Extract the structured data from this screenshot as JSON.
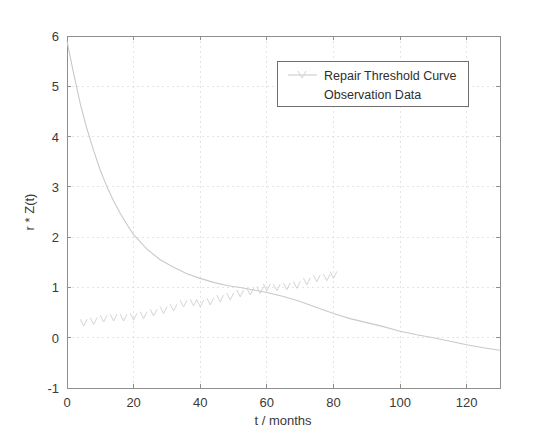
{
  "chart_data": {
    "type": "line",
    "title": "",
    "xlabel": "t / months",
    "ylabel": "r * Z(t)",
    "xlim": [
      0,
      130
    ],
    "ylim": [
      -1,
      6
    ],
    "grid": true,
    "legend_position": "top-right",
    "xticks": [
      0,
      20,
      40,
      60,
      80,
      100,
      120
    ],
    "xtick_labels": [
      "0",
      "20",
      "40",
      "60",
      "80",
      "100",
      "120"
    ],
    "yticks": [
      -1,
      0,
      1,
      2,
      3,
      4,
      5,
      6
    ],
    "ytick_labels": [
      "-1",
      "0",
      "1",
      "2",
      "3",
      "4",
      "5",
      "6"
    ],
    "series": [
      {
        "name": "Repair Threshold Curve",
        "style": "line",
        "color": "#c9c9c9",
        "x": [
          0,
          2,
          4,
          6,
          8,
          10,
          12,
          14,
          16,
          18,
          20,
          24,
          28,
          32,
          36,
          40,
          44,
          48,
          52,
          56,
          60,
          65,
          70,
          75,
          80,
          85,
          90,
          95,
          100,
          105,
          110,
          115,
          120,
          125,
          130
        ],
        "y": [
          5.9,
          5.25,
          4.65,
          4.15,
          3.72,
          3.33,
          3.0,
          2.72,
          2.47,
          2.25,
          2.05,
          1.76,
          1.55,
          1.4,
          1.27,
          1.18,
          1.1,
          1.04,
          1.0,
          0.95,
          0.9,
          0.82,
          0.72,
          0.6,
          0.48,
          0.38,
          0.3,
          0.22,
          0.13,
          0.06,
          0.0,
          -0.07,
          -0.14,
          -0.2,
          -0.25
        ]
      },
      {
        "name": "Observation Data",
        "style": "marker",
        "marker": "v",
        "color": "#cfcfcf",
        "x": [
          5,
          8,
          11,
          14,
          17,
          20,
          23,
          26,
          29,
          32,
          35,
          38,
          40,
          43,
          46,
          49,
          52,
          55,
          58,
          60,
          63,
          66,
          69,
          72,
          75,
          78,
          80
        ],
        "y": [
          0.3,
          0.33,
          0.38,
          0.4,
          0.4,
          0.42,
          0.45,
          0.5,
          0.55,
          0.6,
          0.68,
          0.7,
          0.68,
          0.72,
          0.78,
          0.82,
          0.88,
          0.92,
          0.95,
          1.0,
          1.0,
          1.02,
          1.05,
          1.12,
          1.18,
          1.2,
          1.25
        ]
      }
    ]
  },
  "legend": {
    "entries": [
      {
        "label": "Repair Threshold Curve"
      },
      {
        "label": "Observation Data"
      }
    ]
  },
  "axes": {
    "x_title": "t / months",
    "y_title": "r * Z(t)"
  }
}
